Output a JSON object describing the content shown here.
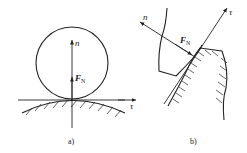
{
  "figure": {
    "panels": [
      {
        "id": "a",
        "caption": "a)",
        "labels": {
          "normal_axis": "n",
          "tangent_axis": "τ",
          "force": "F",
          "force_sub": "N"
        },
        "description": "Circle resting on convex hatched surface; normal axis n vertical, tangent τ horizontal, normal force F_N at contact point"
      },
      {
        "id": "b",
        "caption": "b)",
        "labels": {
          "normal_axis": "n",
          "tangent_axis": "τ",
          "force": "F",
          "force_sub": "N"
        },
        "description": "Two gear-tooth profiles in contact; common tangent τ and common normal n with normal force F_N"
      }
    ],
    "colors": {
      "line": "#222222",
      "background": "#ffffff"
    }
  }
}
